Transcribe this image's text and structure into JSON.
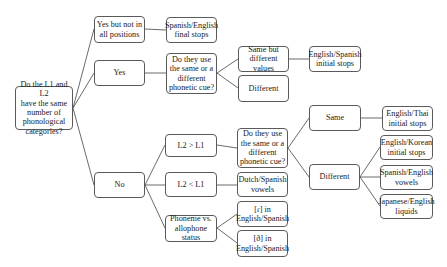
{
  "diagram": {
    "root": "Do the L1 and L2\nhave the same\nnumber of\nphonological\ncategories?",
    "answers": {
      "yes_partial": "Yes but not in\nall positions",
      "yes": "Yes",
      "no": "No"
    },
    "yes_partial_example": "Spanish/English\nfinal stops",
    "yes_question": "Do they use\nthe same or a\ndifferent\nphonetic cue?",
    "yes_cue_options": {
      "same_diff_values": "Same but\ndifferent values",
      "different": "Different"
    },
    "same_diff_values_example": "English/Spanish\ninitial stops",
    "no_branches": {
      "l2_gt_l1": "L2 > L1",
      "l2_lt_l1": "L2 < L1",
      "phoneme_allophone": "Phoneme vs.\nallophone\nstatus"
    },
    "l2_gt_l1_question": "Do they use\nthe same or a\ndifferent\nphonetic cue?",
    "l2_gt_l1_options": {
      "same": "Same",
      "different": "Different"
    },
    "same_example": "English/Thai\ninitial stops",
    "different_examples": [
      "English/Korean\ninitial stops",
      "Spanish/English\nvowels",
      "Japanese/English\nliquids"
    ],
    "l2_lt_l1_example": "Dutch/Spanish\nvowels",
    "phoneme_allophone_examples": [
      "[ɾ] in\nEnglish/Spanish",
      "[ð] in\nEnglish/Spanish"
    ]
  },
  "colors": {
    "border": "#5a5a5a",
    "line": "#444444",
    "background": "#ffffff"
  }
}
